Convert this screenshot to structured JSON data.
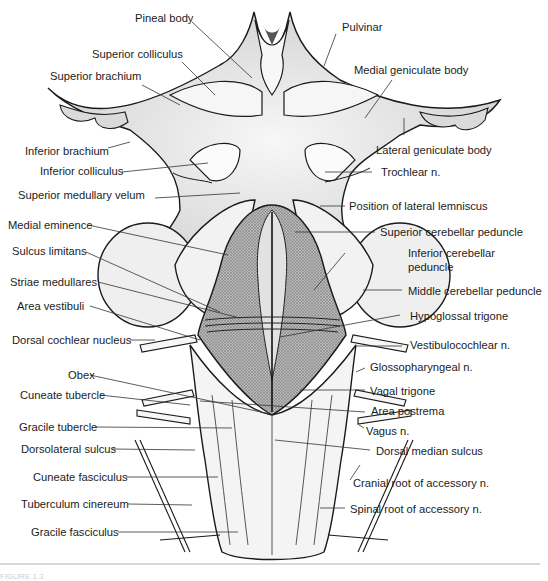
{
  "figure": {
    "caption_fragment": "FIGURE 1.3"
  },
  "labels": {
    "pineal_body": "Pineal body",
    "pulvinar": "Pulvinar",
    "superior_colliculus": "Superior colliculus",
    "superior_brachium": "Superior brachium",
    "medial_geniculate_body": "Medial geniculate body",
    "lateral_geniculate_body": "Lateral geniculate body",
    "inferior_brachium": "Inferior brachium",
    "inferior_colliculus": "Inferior colliculus",
    "trochlear_n": "Trochlear n.",
    "superior_medullary_velum": "Superior medullary velum",
    "position_of_lateral_lemniscus": "Position of lateral lemniscus",
    "medial_eminence": "Medial eminence",
    "superior_cerebellar_peduncle": "Superior cerebellar peduncle",
    "sulcus_limitans": "Sulcus limitans",
    "inferior_cerebellar_peduncle_1": "Inferior cerebellar",
    "inferior_cerebellar_peduncle_2": "peduncle",
    "striae_medullares": "Striae medullares",
    "middle_cerebellar_peduncle": "Middle cerebellar peduncle",
    "area_vestibuli": "Area vestibuli",
    "hypoglossal_trigone": "Hypoglossal trigone",
    "dorsal_cochlear_nucleus": "Dorsal cochlear nucleus",
    "vestibulocochlear_n": "Vestibulocochlear n.",
    "glossopharyngeal_n": "Glossopharyngeal n.",
    "obex": "Obex",
    "vagal_trigone": "Vagal trigone",
    "cuneate_tubercle": "Cuneate tubercle",
    "area_postrema": "Area postrema",
    "gracile_tubercle": "Gracile tubercle",
    "vagus_n": "Vagus n.",
    "dorsal_median_sulcus": "Dorsal median sulcus",
    "dorsolateral_sulcus": "Dorsolateral sulcus",
    "cuneate_fasciculus": "Cuneate fasciculus",
    "cranial_root_of_accessory_n": "Cranial root of accessory n.",
    "tuberculum_cinereum": "Tuberculum cinereum",
    "spinal_root_of_accessory_n": "Spinal root of accessory n.",
    "gracile_fasciculus": "Gracile fasciculus"
  },
  "colors": {
    "outline": "#1a1a1a",
    "shade": "#8a8a8a",
    "fossa": "#9c9c9c",
    "tissue": "#f1f1f1",
    "leader": "#333333"
  }
}
